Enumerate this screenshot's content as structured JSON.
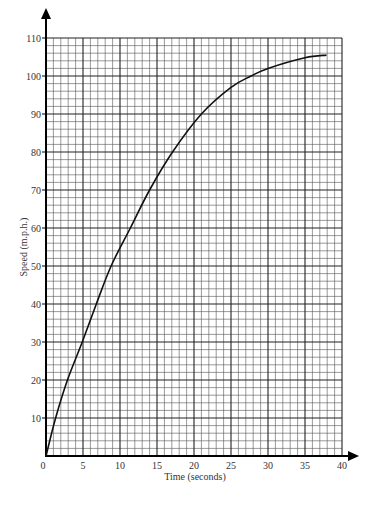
{
  "chart_data": {
    "type": "line",
    "title": "",
    "xlabel": "Time (seconds)",
    "ylabel": "Speed (m.p.h.)",
    "xlim": [
      0,
      40
    ],
    "ylim": [
      0,
      110
    ],
    "x_ticks": [
      0,
      5,
      10,
      15,
      20,
      25,
      30,
      35,
      40
    ],
    "y_ticks": [
      10,
      20,
      30,
      40,
      50,
      60,
      70,
      80,
      90,
      100,
      110
    ],
    "x_minor_step": 1,
    "y_minor_step": 2,
    "grid": true,
    "legend": null,
    "series": [
      {
        "name": "Speed",
        "x": [
          0,
          1.3,
          2.9,
          4.9,
          6.8,
          8.8,
          11.4,
          14.0,
          17.1,
          21.0,
          25.0,
          27.7,
          30.0,
          35.0,
          37.9
        ],
        "values": [
          0,
          10,
          20,
          30,
          40,
          50,
          60,
          70,
          80,
          90,
          97,
          100,
          102,
          104.8,
          105.5
        ]
      }
    ]
  },
  "colors": {
    "grid_major": "#222222",
    "grid_minor": "#555555",
    "curve": "#111111",
    "background": "#ffffff"
  }
}
